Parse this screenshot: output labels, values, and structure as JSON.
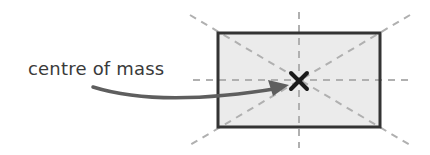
{
  "diagram": {
    "label": "centre of mass",
    "colors": {
      "fill": "#ebebeb",
      "border": "#333333",
      "dash": "#b0b0b0",
      "arrow": "#5e5e5e",
      "cross": "#1a1a1a",
      "text": "#3a3a3a"
    },
    "elements": [
      {
        "name": "rectangle",
        "description": "shaded rectangle"
      },
      {
        "name": "diagonal-lines",
        "description": "dashed diagonals through corners"
      },
      {
        "name": "center-lines",
        "description": "dashed horizontal and vertical center lines"
      },
      {
        "name": "centre-of-mass-marker",
        "description": "cross at intersection"
      },
      {
        "name": "arrow",
        "description": "curved arrow from label to marker"
      }
    ]
  }
}
